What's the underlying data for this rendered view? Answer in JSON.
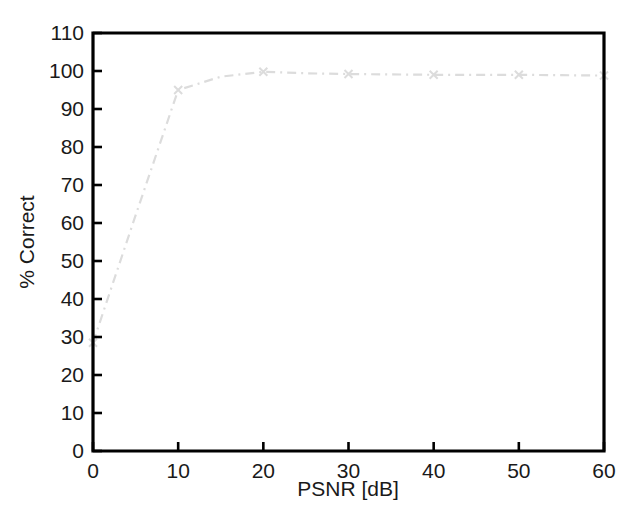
{
  "figure": {
    "background_color": "#ffffff",
    "axes_color": "#000000",
    "text_color": "#1a1a1a"
  },
  "chart_data": {
    "type": "line",
    "title": "",
    "subtitle": "",
    "xlabel": "PSNR [dB]",
    "ylabel": "% Correct",
    "xlim": [
      0,
      60
    ],
    "ylim": [
      0,
      110
    ],
    "xticks": [
      0,
      10,
      20,
      30,
      40,
      50,
      60
    ],
    "yticks": [
      0,
      10,
      20,
      30,
      40,
      50,
      60,
      70,
      80,
      90,
      100,
      110
    ],
    "xticklabels": [
      "0",
      "10",
      "20",
      "30",
      "40",
      "50",
      "60"
    ],
    "yticklabels": [
      "0",
      "10",
      "20",
      "30",
      "40",
      "50",
      "60",
      "70",
      "80",
      "90",
      "100",
      "110"
    ],
    "grid": false,
    "legend": null,
    "legend_position": "none",
    "annotations": [],
    "series": [
      {
        "name": "recognition rate",
        "color": "#dcdcdc",
        "linestyle": "dashdot",
        "marker": "x",
        "x": [
          0,
          5,
          10,
          15,
          20,
          25,
          30,
          35,
          40,
          45,
          50,
          55,
          60
        ],
        "y": [
          28.5,
          62.0,
          95.0,
          98.5,
          99.8,
          99.4,
          99.2,
          99.1,
          99.0,
          99.0,
          99.0,
          98.9,
          98.8
        ]
      }
    ]
  },
  "axis": {
    "x_tick_labels": [
      {
        "value": "0"
      },
      {
        "value": "10"
      },
      {
        "value": "20"
      },
      {
        "value": "30"
      },
      {
        "value": "40"
      },
      {
        "value": "50"
      },
      {
        "value": "60"
      }
    ],
    "y_tick_labels": [
      {
        "value": "110"
      },
      {
        "value": "100"
      },
      {
        "value": "90"
      },
      {
        "value": "80"
      },
      {
        "value": "70"
      },
      {
        "value": "60"
      },
      {
        "value": "50"
      },
      {
        "value": "40"
      },
      {
        "value": "30"
      },
      {
        "value": "20"
      },
      {
        "value": "10"
      },
      {
        "value": "0"
      }
    ],
    "x_axis_title": "PSNR [dB]",
    "y_axis_title": "% Correct"
  }
}
